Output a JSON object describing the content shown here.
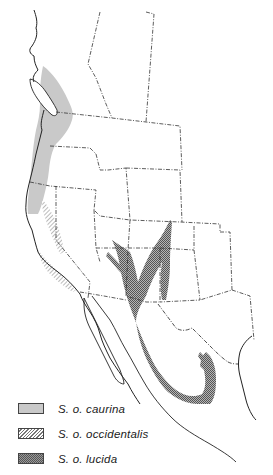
{
  "map": {
    "subject": "Spotted owl subspecies range map, western North America",
    "colors": {
      "background": "#ffffff",
      "coastline": "#222222",
      "border": "#333333",
      "caurina_fill": "#c9c9c9",
      "occidentalis_hatch": "#777777",
      "lucida_fill": "#8c8c8c"
    }
  },
  "legend": {
    "items": [
      {
        "key": "caurina",
        "label": "S. o. caurina",
        "pattern": "light-gray-stipple"
      },
      {
        "key": "occidentalis",
        "label": "S. o. occidentalis",
        "pattern": "diagonal-hatch"
      },
      {
        "key": "lucida",
        "label": "S. o. lucida",
        "pattern": "dark-crosshatch"
      }
    ]
  }
}
